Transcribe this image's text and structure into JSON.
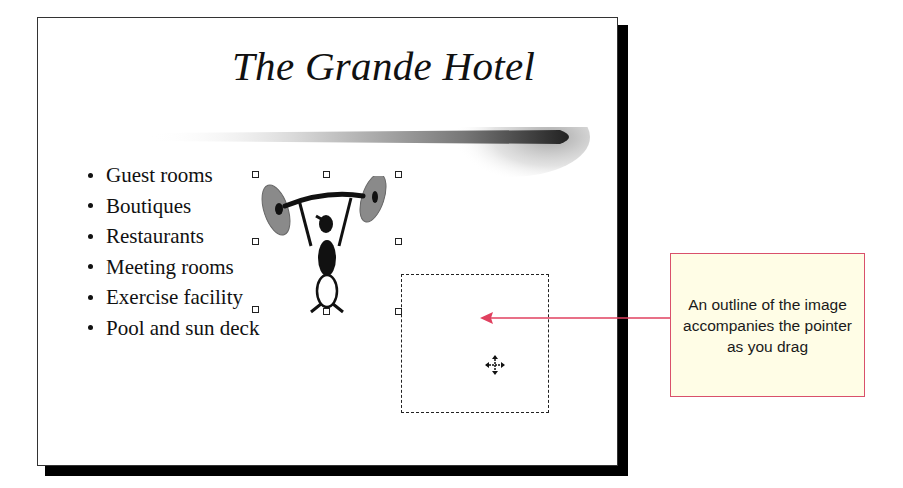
{
  "slide": {
    "title": "The Grande Hotel",
    "bullets": [
      "Guest rooms",
      "Boutiques",
      "Restaurants",
      "Meeting rooms",
      "Exercise facility",
      "Pool and sun deck"
    ],
    "clipart": {
      "icon": "weightlifter-clipart",
      "selected": true
    },
    "drag_outline": {
      "visible": true
    }
  },
  "callout": {
    "text": "An outline of the image accompanies the pointer as you drag",
    "border_color": "#d9506b",
    "fill_color": "#fffde6"
  },
  "colors": {
    "arrow": "#e0405f",
    "slide_shadow": "#000000"
  }
}
